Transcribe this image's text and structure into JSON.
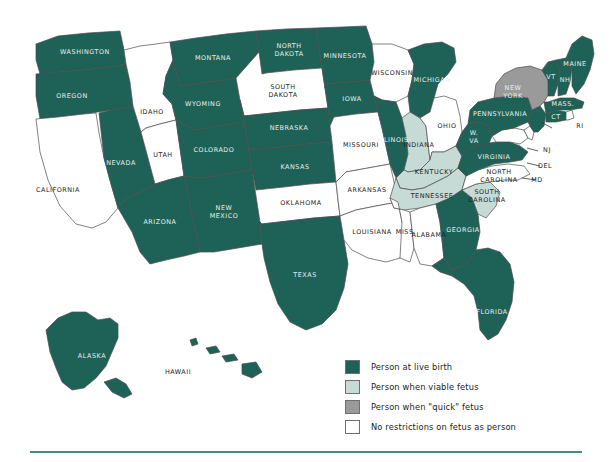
{
  "figure": {
    "name": "us-fetal-personhood-map",
    "background": "#ffffff"
  },
  "palette": {
    "live_birth": "#1e6257",
    "viable_fetus": "#c6dbd6",
    "quick_fetus": "#9a9a9a",
    "none": "#ffffff",
    "border": "#4c4c4c",
    "rule": "#4a8a86",
    "label_light": "#e9efee",
    "label_dark": "#222222"
  },
  "legend": {
    "name": "map-legend",
    "items": [
      {
        "label": "Person at live birth",
        "category": "live_birth",
        "color": "#1e6257"
      },
      {
        "label": "Person when viable fetus",
        "category": "viable_fetus",
        "color": "#c6dbd6"
      },
      {
        "label": "Person when \"quick\" fetus",
        "category": "quick_fetus",
        "color": "#9a9a9a"
      },
      {
        "label": "No restrictions on fetus as person",
        "category": "none",
        "color": "#ffffff"
      }
    ]
  },
  "chart_data": {
    "type": "map",
    "title": "",
    "region": "United States",
    "value_field": "category",
    "categories": [
      "live_birth",
      "viable_fetus",
      "quick_fetus",
      "none"
    ],
    "category_labels": {
      "live_birth": "Person at live birth",
      "viable_fetus": "Person when viable fetus",
      "quick_fetus": "Person when \"quick\" fetus",
      "none": "No restrictions on fetus as person"
    },
    "legend_position": "bottom-right",
    "states": [
      {
        "code": "WA",
        "label": "WASHINGTON",
        "category": "live_birth"
      },
      {
        "code": "OR",
        "label": "OREGON",
        "category": "live_birth"
      },
      {
        "code": "CA",
        "label": "CALIFORNIA",
        "category": "none"
      },
      {
        "code": "NV",
        "label": "NEVADA",
        "category": "live_birth"
      },
      {
        "code": "ID",
        "label": "IDAHO",
        "category": "none"
      },
      {
        "code": "UT",
        "label": "UTAH",
        "category": "none"
      },
      {
        "code": "AZ",
        "label": "ARIZONA",
        "category": "live_birth"
      },
      {
        "code": "MT",
        "label": "MONTANA",
        "category": "live_birth"
      },
      {
        "code": "WY",
        "label": "WYOMING",
        "category": "live_birth"
      },
      {
        "code": "CO",
        "label": "COLORADO",
        "category": "live_birth"
      },
      {
        "code": "NM",
        "label": "NEW MEXICO",
        "category": "live_birth"
      },
      {
        "code": "ND",
        "label": "NORTH DAKOTA",
        "category": "live_birth"
      },
      {
        "code": "SD",
        "label": "SOUTH DAKOTA",
        "category": "none"
      },
      {
        "code": "NE",
        "label": "NEBRASKA",
        "category": "live_birth"
      },
      {
        "code": "KS",
        "label": "KANSAS",
        "category": "live_birth"
      },
      {
        "code": "OK",
        "label": "OKLAHOMA",
        "category": "none"
      },
      {
        "code": "TX",
        "label": "TEXAS",
        "category": "live_birth"
      },
      {
        "code": "MN",
        "label": "MINNESOTA",
        "category": "live_birth"
      },
      {
        "code": "IA",
        "label": "IOWA",
        "category": "live_birth"
      },
      {
        "code": "MO",
        "label": "MISSOURI",
        "category": "none"
      },
      {
        "code": "AR",
        "label": "ARKANSAS",
        "category": "none"
      },
      {
        "code": "LA",
        "label": "LOUISIANA",
        "category": "none"
      },
      {
        "code": "WI",
        "label": "WISCONSIN",
        "category": "none"
      },
      {
        "code": "IL",
        "label": "ILLINOIS",
        "category": "live_birth"
      },
      {
        "code": "MI",
        "label": "MICHIGAN",
        "category": "live_birth"
      },
      {
        "code": "IN",
        "label": "INDIANA",
        "category": "viable_fetus"
      },
      {
        "code": "OH",
        "label": "OHIO",
        "category": "none"
      },
      {
        "code": "KY",
        "label": "KENTUCKY",
        "category": "viable_fetus"
      },
      {
        "code": "TN",
        "label": "TENNESSEE",
        "category": "viable_fetus"
      },
      {
        "code": "MS",
        "label": "MISS.",
        "category": "none"
      },
      {
        "code": "AL",
        "label": "ALABAMA",
        "category": "none"
      },
      {
        "code": "GA",
        "label": "GEORGIA",
        "category": "live_birth"
      },
      {
        "code": "FL",
        "label": "FLORIDA",
        "category": "live_birth"
      },
      {
        "code": "SC",
        "label": "SOUTH CAROLINA",
        "category": "viable_fetus"
      },
      {
        "code": "NC",
        "label": "NORTH CAROLINA",
        "category": "none"
      },
      {
        "code": "VA",
        "label": "VIRGINIA",
        "category": "live_birth"
      },
      {
        "code": "WV",
        "label": "W. VA",
        "category": "live_birth"
      },
      {
        "code": "MD",
        "label": "MD",
        "category": "none"
      },
      {
        "code": "DE",
        "label": "DEL",
        "category": "none"
      },
      {
        "code": "PA",
        "label": "PENNSYLVANIA",
        "category": "live_birth"
      },
      {
        "code": "NJ",
        "label": "NJ",
        "category": "live_birth"
      },
      {
        "code": "NY",
        "label": "NEW YORK",
        "category": "quick_fetus"
      },
      {
        "code": "CT",
        "label": "CT",
        "category": "live_birth"
      },
      {
        "code": "RI",
        "label": "RI",
        "category": "none"
      },
      {
        "code": "MA",
        "label": "MASS.",
        "category": "live_birth"
      },
      {
        "code": "VT",
        "label": "VT",
        "category": "live_birth"
      },
      {
        "code": "NH",
        "label": "NH",
        "category": "live_birth"
      },
      {
        "code": "ME",
        "label": "MAINE",
        "category": "live_birth"
      },
      {
        "code": "AK",
        "label": "ALASKA",
        "category": "live_birth"
      },
      {
        "code": "HI",
        "label": "HAWAII",
        "category": "live_birth"
      }
    ]
  }
}
